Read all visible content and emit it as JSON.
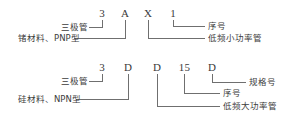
{
  "diagram": {
    "groups": [
      {
        "id": "germanium-pnp-low-power",
        "code_chars": [
          {
            "text": "3",
            "x": 101,
            "y": 8
          },
          {
            "text": "A",
            "x": 124,
            "y": 8
          },
          {
            "text": "X",
            "x": 147,
            "y": 8
          },
          {
            "text": "1",
            "x": 172,
            "y": 8
          }
        ],
        "labels": [
          {
            "text": "三极管",
            "side": "left",
            "x": 60,
            "y": 23
          },
          {
            "text": "锗材料、PNP型",
            "side": "left",
            "x": 20,
            "y": 35
          },
          {
            "text": "序号",
            "side": "right",
            "x": 207,
            "y": 26
          },
          {
            "text": "低频小功率管",
            "side": "right",
            "x": 207,
            "y": 38
          }
        ]
      },
      {
        "id": "silicon-npn-high-power",
        "code_chars": [
          {
            "text": "3",
            "x": 101,
            "y": 62
          },
          {
            "text": "D",
            "x": 127,
            "y": 62
          },
          {
            "text": "D",
            "x": 156,
            "y": 62
          },
          {
            "text": "15",
            "x": 184,
            "y": 62
          },
          {
            "text": "D",
            "x": 211,
            "y": 62
          }
        ],
        "labels": [
          {
            "text": "三极管",
            "side": "left",
            "x": 60,
            "y": 83
          },
          {
            "text": "硅材料、NPN型",
            "side": "left",
            "x": 20,
            "y": 97
          },
          {
            "text": "规格号",
            "side": "right",
            "x": 248,
            "y": 81
          },
          {
            "text": "序号",
            "side": "right",
            "x": 222,
            "y": 92
          },
          {
            "text": "低频大功率管",
            "side": "right",
            "x": 222,
            "y": 105
          }
        ]
      }
    ],
    "colors": {
      "background": "#ffffff",
      "text": "#3c3c3c",
      "code_text": "#3a3a3a",
      "leader_line": "#6f6f6f"
    }
  }
}
